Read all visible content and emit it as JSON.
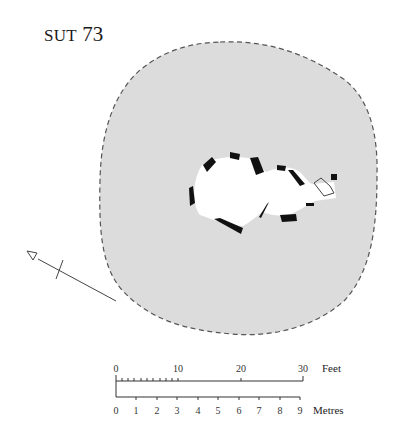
{
  "title": {
    "prefix": "SUT",
    "number": "73"
  },
  "plan": {
    "mound_fill": "#dcdcdc",
    "outline_color": "#555555",
    "stone_color": "#111111",
    "chamber_fill": "#ffffff"
  },
  "north_arrow": {
    "icon": "north-arrow-icon"
  },
  "scale": {
    "feet": {
      "label": "Feet",
      "ticks": [
        "0",
        "10",
        "20",
        "30"
      ]
    },
    "metres": {
      "label": "Metres",
      "ticks": [
        "0",
        "1",
        "2",
        "3",
        "4",
        "5",
        "6",
        "7",
        "8",
        "9"
      ]
    }
  }
}
